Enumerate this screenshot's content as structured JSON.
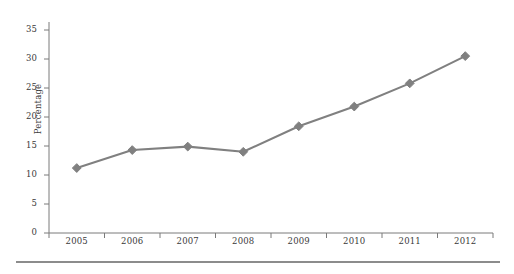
{
  "chart_data": {
    "type": "line",
    "title": "",
    "xlabel": "",
    "ylabel": "Percentage",
    "categories": [
      "2005",
      "2006",
      "2007",
      "2008",
      "2009",
      "2010",
      "2011",
      "2012"
    ],
    "values": [
      11.2,
      14.3,
      14.9,
      14.0,
      18.4,
      21.8,
      25.8,
      30.5
    ],
    "ylim": [
      0,
      35
    ],
    "yticks": [
      0,
      5,
      10,
      15,
      20,
      25,
      30,
      35
    ],
    "ytick_labels": [
      "0",
      "5",
      "10",
      "15",
      "20",
      "25",
      "30",
      "35"
    ],
    "grid": false,
    "legend": null,
    "marker": "diamond",
    "series": [
      {
        "name": "Percentage",
        "values": [
          11.2,
          14.3,
          14.9,
          14.0,
          18.4,
          21.8,
          25.8,
          30.5
        ]
      }
    ],
    "colors": {
      "line": "#808080",
      "marker": "#808080",
      "axis": "#7a7a7a",
      "text": "#3a3a3a",
      "rule": "#8c8c8c",
      "background": "#ffffff"
    }
  }
}
